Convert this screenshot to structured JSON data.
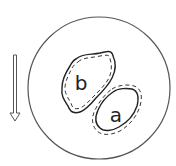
{
  "diagram": {
    "type": "circle-with-two-regions",
    "regions": [
      {
        "label": "b",
        "outline": "solid outer, dashed inner"
      },
      {
        "label": "a",
        "outline": "solid inner, dashed outer"
      }
    ],
    "arrow": {
      "direction": "down",
      "style": "hollow double-line"
    },
    "colors": {
      "stroke": "#333333",
      "circle": "#555555",
      "background": "#ffffff"
    }
  }
}
